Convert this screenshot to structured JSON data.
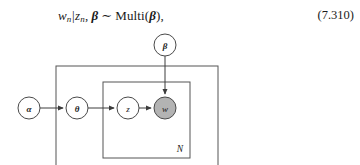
{
  "equation": {
    "lhs_var": "w",
    "lhs_sub": "n",
    "bar": "|",
    "cond_var": "z",
    "cond_sub": "n",
    "comma1": ",",
    "param_bold": "β",
    "sim": "∼",
    "dist_name": "Multi(",
    "dist_arg": "β",
    "dist_close": "),",
    "number": "(7.310)"
  },
  "diagram": {
    "type": "plate-notation-graphical-model",
    "nodes": [
      {
        "id": "alpha",
        "label": "α",
        "style": "open",
        "bold": true,
        "cx": 29,
        "cy": 78,
        "r": 11
      },
      {
        "id": "theta",
        "label": "θ",
        "style": "open",
        "bold": true,
        "cx": 77,
        "cy": 78,
        "r": 11
      },
      {
        "id": "z",
        "label": "z",
        "style": "open",
        "bold": false,
        "cx": 128,
        "cy": 78,
        "r": 11
      },
      {
        "id": "w",
        "label": "w",
        "style": "shaded",
        "bold": false,
        "cx": 165,
        "cy": 78,
        "r": 11
      },
      {
        "id": "beta",
        "label": "β",
        "style": "open",
        "bold": true,
        "cx": 165,
        "cy": 15,
        "r": 11
      }
    ],
    "edges": [
      {
        "from": "alpha",
        "to": "theta"
      },
      {
        "from": "theta",
        "to": "z"
      },
      {
        "from": "z",
        "to": "w"
      },
      {
        "from": "beta",
        "to": "w"
      }
    ],
    "plates": [
      {
        "id": "outer",
        "label": "M",
        "x": 56,
        "y": 36,
        "w": 162,
        "h": 117,
        "label_x": 208,
        "label_y": 143
      },
      {
        "id": "inner",
        "label": "N",
        "x": 103,
        "y": 52,
        "w": 87,
        "h": 76,
        "label_x": 180,
        "label_y": 119
      }
    ],
    "colors": {
      "observed_node_fill": "#b3b3b3",
      "latent_node_fill": "#ffffff",
      "stroke": "#4a4a4a",
      "plate_stroke": "#555555"
    }
  }
}
